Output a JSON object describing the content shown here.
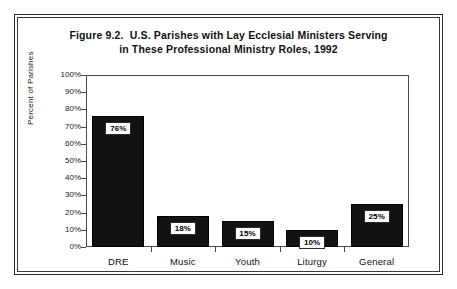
{
  "figure": {
    "title_line1": "Figure 9.2.  U.S. Parishes with Lay Ecclesial Ministers Serving",
    "title_line2": "in These Professional Ministry Roles, 1992"
  },
  "chart_data": {
    "type": "bar",
    "title": "Figure 9.2.  U.S. Parishes with Lay Ecclesial Ministers Serving in These Professional Ministry Roles, 1992",
    "xlabel": "",
    "ylabel": "Percent of Parishes",
    "ylim": [
      0,
      100
    ],
    "ytick_labels": [
      "100%",
      "90%",
      "80%",
      "70%",
      "60%",
      "50%",
      "40%",
      "30%",
      "20%",
      "10%",
      "0%"
    ],
    "ytick_values": [
      100,
      90,
      80,
      70,
      60,
      50,
      40,
      30,
      20,
      10,
      0
    ],
    "grid": false,
    "legend": false,
    "categories": [
      "DRE",
      "Music",
      "Youth",
      "Liturgy",
      "General"
    ],
    "values": [
      76,
      18,
      15,
      10,
      25
    ],
    "data_labels": [
      "76%",
      "18%",
      "15%",
      "10%",
      "25%"
    ],
    "bar_color": "#121212"
  }
}
